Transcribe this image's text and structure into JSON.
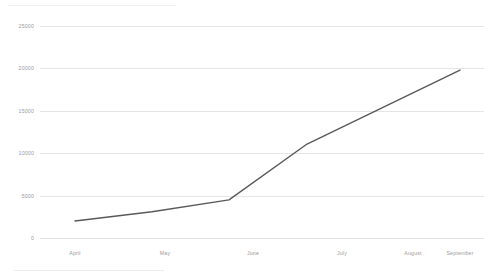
{
  "chart_data": {
    "type": "line",
    "title": "",
    "subtitle": "",
    "xlabel": "",
    "ylabel": "",
    "categories": [
      "April",
      "May",
      "June",
      "July",
      "August",
      "September"
    ],
    "x": [
      "April",
      "May",
      "June",
      "July",
      "August",
      "September"
    ],
    "series": [
      {
        "name": "series-1",
        "color": "#595959",
        "values": [
          2000,
          3100,
          4500,
          11000,
          15400,
          19800
        ]
      }
    ],
    "values": [
      2000,
      3100,
      4500,
      11000,
      15400,
      19800
    ],
    "ylim": [
      0,
      25000
    ],
    "ytick_values": [
      0,
      5000,
      10000,
      15000,
      20000,
      25000
    ],
    "ytick_labels": [
      "0",
      "5000",
      "10000",
      "15000",
      "20000",
      "25000"
    ],
    "xtick_labels": [
      "April",
      "May",
      "June",
      "July",
      "August",
      "September"
    ],
    "grid": true,
    "grid_axis": "y",
    "grid_color": "#e4e5e8",
    "legend": false,
    "legend_position": "none",
    "markers": false,
    "line_width": 1.4,
    "background_color": "#ffffff",
    "axis_label_color": "#9a9aa0"
  },
  "axes": {
    "y_labels": [
      "25000",
      "20000",
      "15000",
      "10000",
      "5000",
      "0"
    ],
    "x_labels": [
      "April",
      "May",
      "June",
      "July",
      "August",
      "September"
    ]
  }
}
